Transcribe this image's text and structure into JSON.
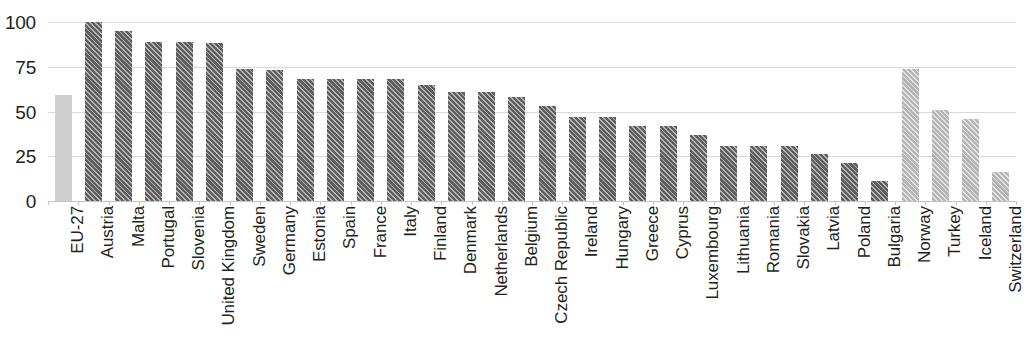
{
  "chart_data": {
    "type": "bar",
    "title": "",
    "subtitle": "",
    "xlabel": "",
    "ylabel": "",
    "ylim": [
      0,
      100
    ],
    "y_ticks": [
      0,
      25,
      50,
      75,
      100
    ],
    "grid": true,
    "legend": "none",
    "orientation": "vertical",
    "x_tick_label_rotation": 90,
    "colors": {
      "aggregate": "#cfcfcf",
      "member": "#5e5e5e",
      "nonmember": "#b4b4b4",
      "gridline": "#d9d9d9",
      "axis_text": "#231f20",
      "background": "#ffffff"
    },
    "categories": [
      "EU-27",
      "Austria",
      "Malta",
      "Portugal",
      "Slovenia",
      "United Kingdom",
      "Sweden",
      "Germany",
      "Estonia",
      "Spain",
      "France",
      "Italy",
      "Finland",
      "Denmark",
      "Netherlands",
      "Belgium",
      "Czech Republic",
      "Ireland",
      "Hungary",
      "Greece",
      "Cyprus",
      "Luxembourg",
      "Lithuania",
      "Romania",
      "Slovakia",
      "Latvia",
      "Poland",
      "Bulgaria",
      "Norway",
      "Turkey",
      "Iceland",
      "Switzerland"
    ],
    "values": [
      59,
      100,
      95,
      89,
      89,
      88,
      74,
      73,
      68,
      68,
      68,
      68,
      65,
      61,
      61,
      58,
      53,
      47,
      47,
      42,
      42,
      37,
      31,
      31,
      31,
      26,
      21,
      11,
      74,
      51,
      46,
      16
    ],
    "series_groups": [
      "aggregate",
      "member",
      "member",
      "member",
      "member",
      "member",
      "member",
      "member",
      "member",
      "member",
      "member",
      "member",
      "member",
      "member",
      "member",
      "member",
      "member",
      "member",
      "member",
      "member",
      "member",
      "member",
      "member",
      "member",
      "member",
      "member",
      "member",
      "member",
      "nonmember",
      "nonmember",
      "nonmember",
      "nonmember"
    ]
  }
}
